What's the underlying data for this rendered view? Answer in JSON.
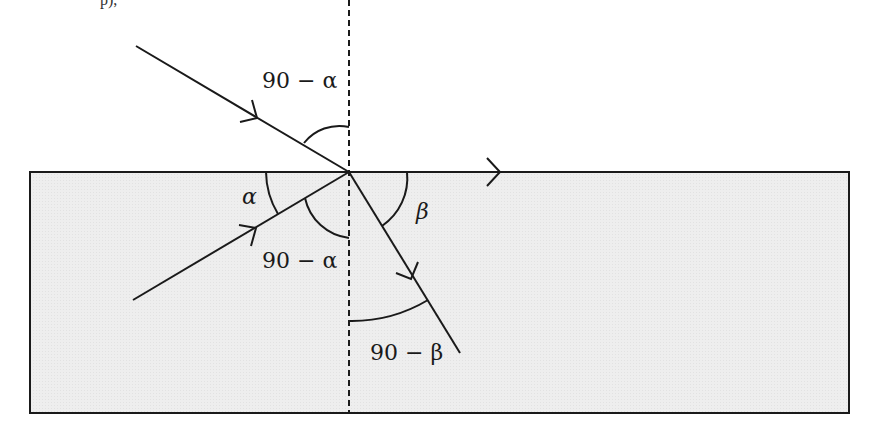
{
  "diagram": {
    "top_fragment": "p),",
    "colors": {
      "stroke": "#1a1a1a",
      "medium_fill": "#ededed",
      "background": "#ffffff"
    },
    "labels": {
      "upper_complement_alpha": "90 − α",
      "alpha": "α",
      "lower_complement_alpha": "90 − α",
      "beta": "β",
      "complement_beta": "90 − β"
    },
    "elements": {
      "medium_box": {
        "x": 30,
        "y": 172,
        "width": 819,
        "height": 241
      },
      "normal_line": {
        "x": 349,
        "y1": 0,
        "y2": 413,
        "style": "dashed"
      },
      "point_of_incidence": {
        "x": 349,
        "y": 172
      },
      "incident_ray": {
        "from": [
          136,
          46
        ],
        "to": [
          349,
          172
        ]
      },
      "lower_ray": {
        "from": [
          133,
          300
        ],
        "to": [
          349,
          172
        ]
      },
      "surface_ray": {
        "from": [
          349,
          172
        ],
        "to": [
          500,
          172
        ]
      },
      "refracted_ray": {
        "from": [
          349,
          172
        ],
        "to": [
          460,
          353
        ]
      }
    }
  }
}
